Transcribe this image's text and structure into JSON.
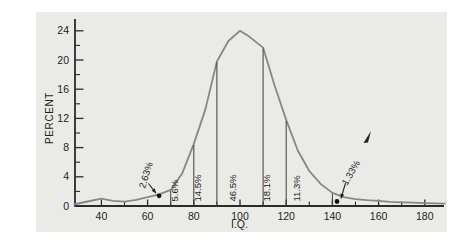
{
  "chart_data": {
    "type": "line",
    "title": "",
    "xlabel": "I.Q.",
    "ylabel": "PERCENT",
    "xlim": [
      27,
      190
    ],
    "ylim": [
      0,
      26
    ],
    "grid": false,
    "x_major_ticks": [
      40,
      60,
      80,
      100,
      120,
      140,
      160,
      180
    ],
    "x_minor_ticks": [
      50,
      70,
      90,
      110,
      130,
      150,
      170
    ],
    "y_major_ticks": [
      0,
      4,
      8,
      12,
      16,
      20,
      24
    ],
    "y_minor_ticks": [
      2,
      6,
      10,
      14,
      18,
      22
    ],
    "curve_points": [
      [
        28,
        0.2
      ],
      [
        33,
        0.55
      ],
      [
        40,
        1.0
      ],
      [
        45,
        0.7
      ],
      [
        50,
        0.6
      ],
      [
        55,
        0.85
      ],
      [
        60,
        1.2
      ],
      [
        65,
        1.6
      ],
      [
        70,
        2.2
      ],
      [
        75,
        4.5
      ],
      [
        80,
        8.5
      ],
      [
        85,
        13.2
      ],
      [
        90,
        19.8
      ],
      [
        95,
        22.6
      ],
      [
        100,
        24
      ],
      [
        104,
        23.2
      ],
      [
        110,
        21.7
      ],
      [
        115,
        16.5
      ],
      [
        120,
        11.8
      ],
      [
        125,
        7.6
      ],
      [
        130,
        4.8
      ],
      [
        135,
        3.0
      ],
      [
        140,
        1.8
      ],
      [
        145,
        1.2
      ],
      [
        150,
        0.95
      ],
      [
        155,
        0.8
      ],
      [
        160,
        0.7
      ],
      [
        165,
        0.58
      ],
      [
        170,
        0.5
      ],
      [
        175,
        0.45
      ],
      [
        180,
        0.4
      ],
      [
        185,
        0.35
      ],
      [
        189,
        0.32
      ]
    ],
    "dividers": [
      {
        "iq": 70,
        "pct": 2.2
      },
      {
        "iq": 80,
        "pct": 8.5
      },
      {
        "iq": 90,
        "pct": 19.8
      },
      {
        "iq": 110,
        "pct": 21.7
      },
      {
        "iq": 120,
        "pct": 11.8
      },
      {
        "iq": 140,
        "pct": 1.8
      }
    ],
    "region_labels": [
      {
        "text": "5.6%",
        "iq": 74.5
      },
      {
        "text": "14.5%",
        "iq": 84.5
      },
      {
        "text": "46.5%",
        "iq": 99.5
      },
      {
        "text": "18.1%",
        "iq": 114.5
      },
      {
        "text": "11.3%",
        "iq": 127.5
      }
    ],
    "callouts": [
      {
        "text": "2.63%",
        "dot": [
          65,
          1.4
        ],
        "text_at": [
          145,
          189
        ],
        "rotate": -73,
        "arrow": [
          [
            148.5,
            183.5
          ],
          [
            156,
            193.2
          ]
        ],
        "flag": false
      },
      {
        "text": "1.33%",
        "dot": [
          142,
          0.62
        ],
        "text_at": [
          347,
          186
        ],
        "rotate": -60,
        "arrow": [
          [
            345.5,
            183
          ],
          [
            341,
            198.5
          ]
        ],
        "flag": true
      }
    ],
    "regions_summary": [
      {
        "iq_range": "below 70",
        "percent": "2.63%"
      },
      {
        "iq_range": "70-80",
        "percent": "5.6%"
      },
      {
        "iq_range": "80-90",
        "percent": "14.5%"
      },
      {
        "iq_range": "90-110",
        "percent": "46.5%"
      },
      {
        "iq_range": "110-120",
        "percent": "18.1%"
      },
      {
        "iq_range": "120-140",
        "percent": "11.3%"
      },
      {
        "iq_range": "above 140",
        "percent": "1.33%"
      }
    ],
    "colors": {
      "panel": "#eaeae6",
      "curve": "#878787",
      "axis": "#2b2b2b",
      "divider": "#3d3d3d",
      "text": "#1e1e1e",
      "dot": "#111111"
    }
  }
}
